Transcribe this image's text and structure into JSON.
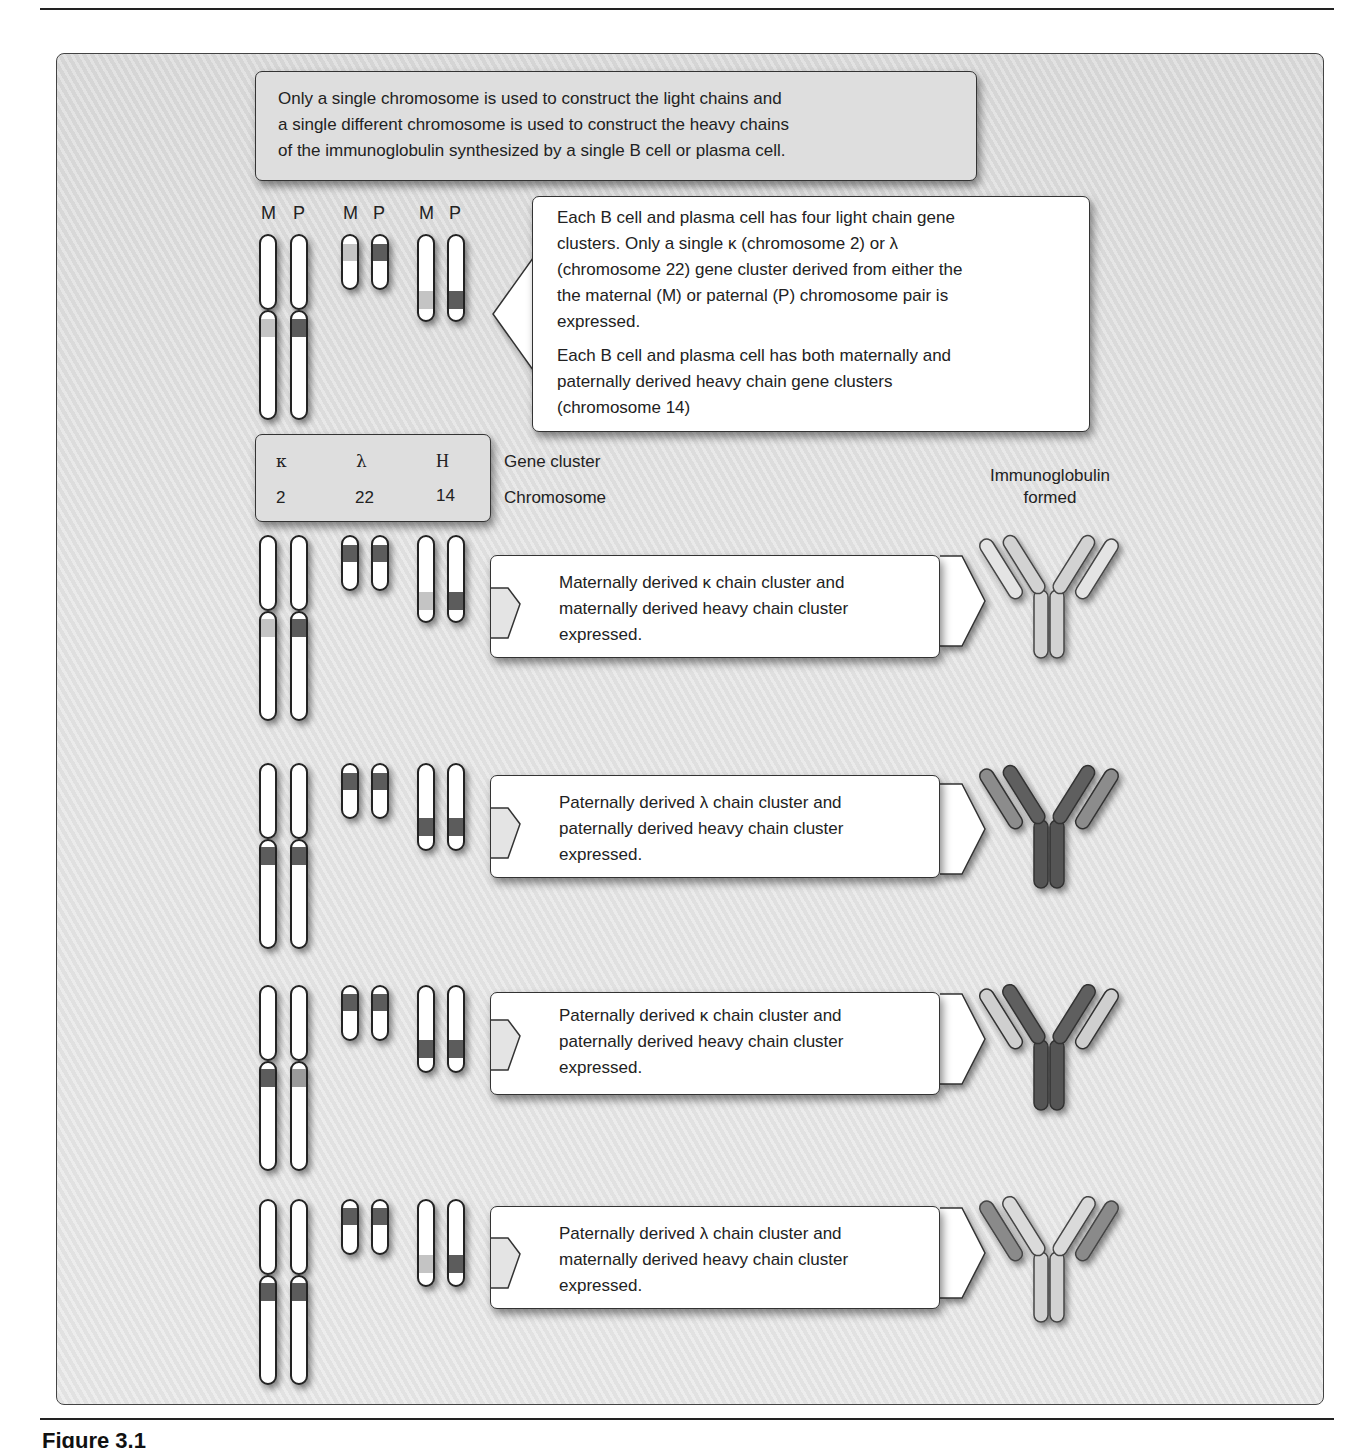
{
  "header_note": {
    "lines": [
      "Only a single chromosome is used to construct the light chains and",
      "a single different chromosome is used to construct the heavy chains",
      "of the immunoglobulin synthesized by a single B cell or plasma cell."
    ]
  },
  "chromosome_labels": [
    "M",
    "P",
    "M",
    "P",
    "M",
    "P"
  ],
  "info_box": {
    "para1_lines": [
      "Each B cell and plasma cell has four light chain gene",
      "clusters.  Only a single κ (chromosome 2) or λ",
      "(chromosome 22) gene cluster derived from either the",
      "the maternal (M) or paternal (P) chromosome pair is",
      "expressed."
    ],
    "para2_lines": [
      "Each B cell and plasma cell has both maternally and",
      "paternally derived heavy chain gene clusters",
      "(chromosome 14)"
    ]
  },
  "legend": {
    "gene_clusters": [
      "κ",
      "λ",
      "H"
    ],
    "chromosomes": [
      "2",
      "22",
      "14"
    ],
    "gene_cluster_label": "Gene cluster",
    "chromosome_label": "Chromosome"
  },
  "immunoglobulin_header": [
    "Immunoglobulin",
    "formed"
  ],
  "colors": {
    "maternal_band": "#bdbdbd",
    "paternal_band": "#5a5a5a",
    "chromosome_fill": "#ffffff",
    "panel_bg": "#e3e3e3"
  },
  "scenarios": [
    {
      "lines": [
        "Maternally derived κ chain cluster and",
        "maternally derived heavy chain cluster",
        "expressed."
      ],
      "light_source": "maternal",
      "light_cluster": "kappa",
      "heavy_source": "maternal"
    },
    {
      "lines": [
        "Paternally derived λ chain cluster and",
        "paternally derived heavy chain cluster",
        "expressed."
      ],
      "light_source": "paternal",
      "light_cluster": "lambda",
      "heavy_source": "paternal"
    },
    {
      "lines": [
        "Paternally derived κ chain cluster and",
        "paternally derived heavy chain cluster",
        "expressed."
      ],
      "light_source": "paternal",
      "light_cluster": "kappa",
      "heavy_source": "paternal"
    },
    {
      "lines": [
        "Paternally derived λ chain cluster and",
        "maternally derived heavy chain cluster",
        "expressed."
      ],
      "light_source": "paternal",
      "light_cluster": "lambda",
      "heavy_source": "maternal"
    }
  ],
  "figure_caption": "Figure 3.1"
}
